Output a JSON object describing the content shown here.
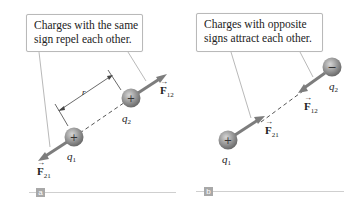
{
  "panel_a": {
    "tag": "a",
    "callout_lines": [
      "Charges with the same",
      "sign repel each other."
    ],
    "q1": {
      "name": "q",
      "sub": "1",
      "sign": "+"
    },
    "q2": {
      "name": "q",
      "sub": "2",
      "sign": "+"
    },
    "distance_label": "r",
    "force_12": {
      "symbol": "F",
      "sub": "12"
    },
    "force_21": {
      "symbol": "F",
      "sub": "21"
    }
  },
  "panel_b": {
    "tag": "b",
    "callout_lines": [
      "Charges with opposite",
      "signs attract each other."
    ],
    "q1": {
      "name": "q",
      "sub": "1",
      "sign": "+"
    },
    "q2": {
      "name": "q",
      "sub": "2",
      "sign": "−"
    },
    "force_12": {
      "symbol": "F",
      "sub": "12"
    },
    "force_21": {
      "symbol": "F",
      "sub": "21"
    }
  },
  "colors": {
    "arrow": "#7d7d7d",
    "charge_fill": "#8e8e8e",
    "callout_border": "#b9b9b9",
    "tag_bg": "#a8a8a8",
    "rule": "#cfcfcf"
  }
}
